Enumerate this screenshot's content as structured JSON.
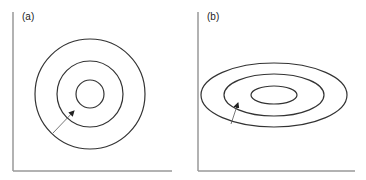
{
  "panels": [
    {
      "id": "a",
      "label": "(a)",
      "shape": "circles",
      "axes": {
        "x0": 13,
        "y_top": 12,
        "y_bottom": 171,
        "x_right": 172
      },
      "center": [
        90,
        94
      ],
      "contours": [
        {
          "rx": 55,
          "ry": 55
        },
        {
          "rx": 33,
          "ry": 33
        },
        {
          "rx": 14,
          "ry": 14
        }
      ],
      "arrow": {
        "from": [
          53,
          133
        ],
        "to": [
          74,
          111
        ]
      }
    },
    {
      "id": "b",
      "label": "(b)",
      "shape": "ellipses",
      "axes": {
        "x0": 198,
        "y_top": 12,
        "y_bottom": 171,
        "x_right": 355
      },
      "center": [
        274,
        95
      ],
      "contours": [
        {
          "rx": 73,
          "ry": 32
        },
        {
          "rx": 50,
          "ry": 21
        },
        {
          "rx": 23,
          "ry": 9
        }
      ],
      "arrow": {
        "from": [
          231,
          124
        ],
        "to": [
          238,
          103
        ]
      }
    }
  ],
  "colors": {
    "axis": "#999999",
    "contour": "#333333",
    "arrow": "#555555"
  }
}
